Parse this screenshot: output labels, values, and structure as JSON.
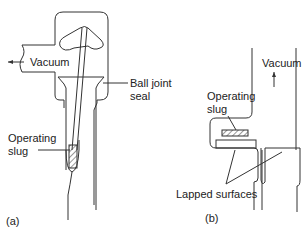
{
  "figure_a": {
    "panel_label": "(a)",
    "labels": {
      "vacuum": "Vacuum",
      "ball_joint_line1": "Ball joint",
      "ball_joint_line2": "seal",
      "slug_line1": "Operating",
      "slug_line2": "slug"
    }
  },
  "figure_b": {
    "panel_label": "(b)",
    "labels": {
      "vacuum": "Vacuum",
      "slug_line1": "Operating",
      "slug_line2": "slug",
      "lapped": "Lapped surfaces"
    }
  },
  "colors": {
    "line": "#333333",
    "text": "#222222"
  }
}
